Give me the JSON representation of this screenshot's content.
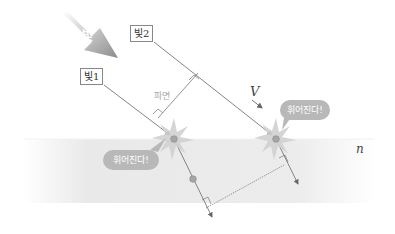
{
  "diagram": {
    "big_arrow_label": "빛",
    "ray_labels": [
      "빛1",
      "빛2"
    ],
    "wavefront_label": "파면",
    "velocity_label": "V",
    "medium_label": "n",
    "bubbles": [
      "휘어진다!",
      "휘어진다!"
    ],
    "colors": {
      "medium_band": "#ececec",
      "ray_line": "#777777",
      "hit_point": "#a6a6a6",
      "bubble": "#b8b8b8",
      "big_arrow": "#9a9a9a"
    }
  }
}
